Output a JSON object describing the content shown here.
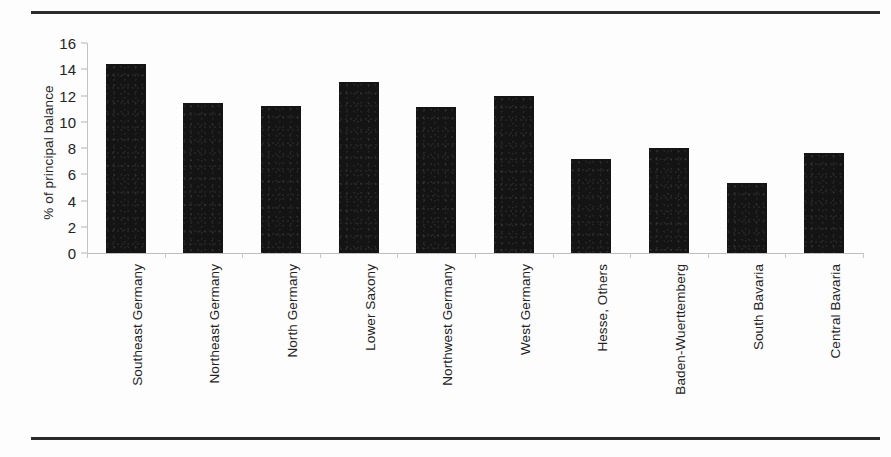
{
  "figure": {
    "background_color": "#fdfdfd",
    "rule_color": "#2b2b2b",
    "bar_color": "#141414",
    "axis_color": "#c3c3c3",
    "text_color": "#222222"
  },
  "chart_data": {
    "type": "bar",
    "title": "",
    "xlabel": "",
    "ylabel": "% of principal balance",
    "ylim": [
      0,
      16
    ],
    "yticks": [
      0,
      2,
      4,
      6,
      8,
      10,
      12,
      14,
      16
    ],
    "grid": false,
    "legend": null,
    "categories": [
      "Southeast Germany",
      "Northeast Germany",
      "North Germany",
      "Lower Saxony",
      "Northwest Germany",
      "West Germany",
      "Hesse, Others",
      "Baden-Wuerttemberg",
      "South Bavaria",
      "Central Bavaria"
    ],
    "values": [
      14.4,
      11.4,
      11.2,
      13.0,
      11.1,
      12.0,
      7.2,
      8.0,
      5.3,
      7.6
    ]
  }
}
